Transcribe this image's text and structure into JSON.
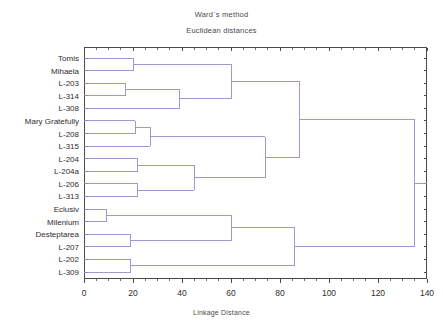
{
  "chart_data": {
    "type": "dendrogram",
    "title": "Ward`s method",
    "subtitle": "Euclidean distances",
    "xlabel": "Linkage Distance",
    "ylabel": "",
    "xlim": [
      0,
      140
    ],
    "xticks": [
      0,
      20,
      40,
      60,
      80,
      100,
      120,
      140
    ],
    "grid": false,
    "legend": false,
    "line_color": "#8f8fd0",
    "axis_color": "#4a4a4a",
    "leaves": [
      "Tomis",
      "Mihaela",
      "L-203",
      "L-314",
      "L-308",
      "Mary Gratefully",
      "L-208",
      "L-315",
      "L-204",
      "L-204a",
      "L-206",
      "L-313",
      "Eclusiv",
      "Milenium",
      "Desteptarea",
      "L-207",
      "L-202",
      "L-309"
    ],
    "merges": [
      {
        "id": "m1",
        "left": "Eclusiv",
        "right": "Milenium",
        "distance": 9
      },
      {
        "id": "m2",
        "left": "L-203",
        "right": "L-314",
        "distance": 17
      },
      {
        "id": "m3",
        "left": "Tomis",
        "right": "Mihaela",
        "distance": 20
      },
      {
        "id": "m4",
        "left": "Mary Gratefully",
        "right": "L-208",
        "distance": 21
      },
      {
        "id": "m5",
        "left": "L-204",
        "right": "L-204a",
        "distance": 22
      },
      {
        "id": "m6",
        "left": "L-206",
        "right": "L-313",
        "distance": 22
      },
      {
        "id": "m7",
        "left": "Desteptarea",
        "right": "L-207",
        "distance": 19
      },
      {
        "id": "m8",
        "left": "L-202",
        "right": "L-309",
        "distance": 19
      },
      {
        "id": "m9",
        "left": "m2",
        "right": "L-308",
        "distance": 39
      },
      {
        "id": "m10",
        "left": "m4",
        "right": "L-315",
        "distance": 27
      },
      {
        "id": "m11",
        "left": "m5",
        "right": "m6",
        "distance": 45
      },
      {
        "id": "m12",
        "left": "m3",
        "right": "m9",
        "distance": 60
      },
      {
        "id": "m13",
        "left": "m1",
        "right": "m7",
        "distance": 60
      },
      {
        "id": "m14",
        "left": "m10",
        "right": "m11",
        "distance": 74
      },
      {
        "id": "m15",
        "left": "m12",
        "right": "m14",
        "distance": 88
      },
      {
        "id": "m16",
        "left": "m13",
        "right": "m8",
        "distance": 86
      },
      {
        "id": "m17",
        "left": "m15",
        "right": "m16",
        "distance": 135
      }
    ]
  }
}
